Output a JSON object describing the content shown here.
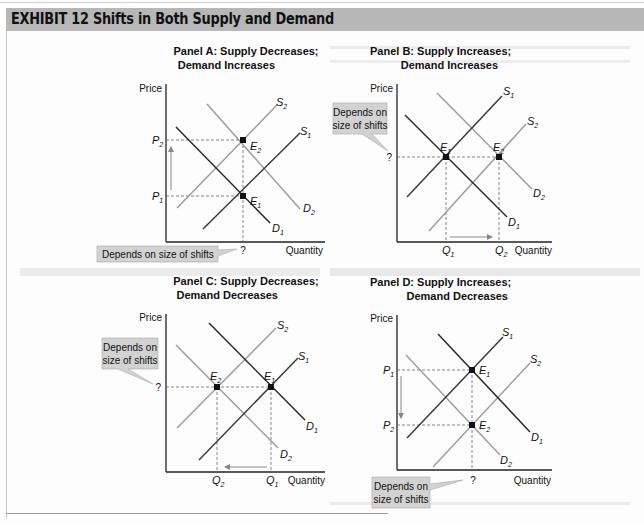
{
  "exhibit": {
    "title": "EXHIBIT 12  Shifts in Both Supply and Demand"
  },
  "axis_labels": {
    "price": "Price",
    "quantity": "Quantity"
  },
  "callout_text": {
    "single_line": "Depends on size of shifts",
    "line1": "Depends on",
    "line2": "size of shifts"
  },
  "panels": [
    {
      "id": "A",
      "title_line1": "Panel A: Supply Decreases;",
      "title_line2": "Demand Increases",
      "price_labels": [
        "P1",
        "P2"
      ],
      "quantity_labels": [
        "?"
      ],
      "equilibria": [
        "E1",
        "E2"
      ],
      "curves": [
        "S1",
        "S2",
        "D1",
        "D2"
      ],
      "result": {
        "price": "increases (P1 to P2)",
        "quantity": "Depends on size of shifts"
      }
    },
    {
      "id": "B",
      "title_line1": "Panel B: Supply Increases;",
      "title_line2": "Demand Increases",
      "price_labels": [
        "?"
      ],
      "quantity_labels": [
        "Q1",
        "Q2"
      ],
      "equilibria": [
        "E1",
        "E2"
      ],
      "curves": [
        "S1",
        "S2",
        "D1",
        "D2"
      ],
      "result": {
        "price": "Depends on size of shifts",
        "quantity": "increases (Q1 to Q2)"
      }
    },
    {
      "id": "C",
      "title_line1": "Panel C: Supply Decreases;",
      "title_line2": "Demand Decreases",
      "price_labels": [
        "?"
      ],
      "quantity_labels": [
        "Q2",
        "Q1"
      ],
      "equilibria": [
        "E2",
        "E1"
      ],
      "curves": [
        "S1",
        "S2",
        "D1",
        "D2"
      ],
      "result": {
        "price": "Depends on size of shifts",
        "quantity": "decreases (Q1 to Q2)"
      }
    },
    {
      "id": "D",
      "title_line1": "Panel D: Supply Increases;",
      "title_line2": "Demand Decreases",
      "price_labels": [
        "P1",
        "P2"
      ],
      "quantity_labels": [
        "?"
      ],
      "equilibria": [
        "E1",
        "E2"
      ],
      "curves": [
        "S1",
        "S2",
        "D1",
        "D2"
      ],
      "result": {
        "price": "decreases (P1 to P2)",
        "quantity": "Depends on size of shifts"
      }
    }
  ],
  "colors": {
    "title_bar": "#b7b7b7",
    "original_curve": "#3a3a3a",
    "shifted_curve": "#9a9a9a",
    "callout_fill": "#d2d2d2",
    "dashed": "#666666"
  }
}
